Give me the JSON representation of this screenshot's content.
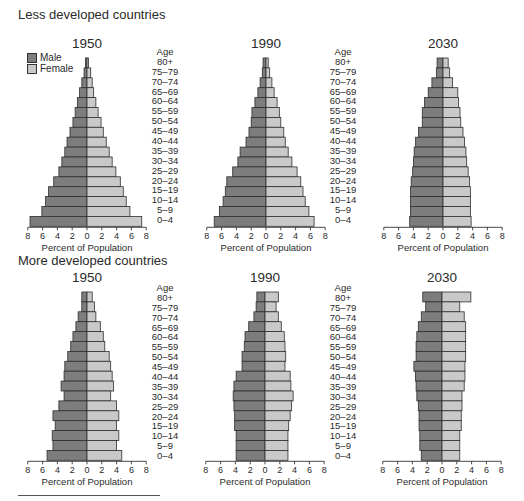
{
  "colors": {
    "male": "#7d7d7d",
    "female": "#c9c9c9",
    "stroke": "#2f2f2f"
  },
  "legend": [
    {
      "label": "Male",
      "series": "male"
    },
    {
      "label": "Female",
      "series": "female"
    }
  ],
  "sections": [
    {
      "title": "Less developed countries"
    },
    {
      "title": "More developed countries"
    }
  ],
  "age_header": "Age",
  "age_groups": [
    "80+",
    "75–79",
    "70–74",
    "65–69",
    "60–64",
    "55–59",
    "50–54",
    "45–49",
    "40–44",
    "35–39",
    "30–34",
    "25–29",
    "20–24",
    "15–19",
    "10–14",
    "5–9",
    "0–4"
  ],
  "chart_data": [
    {
      "type": "bar",
      "orientation": "horizontal-pyramid",
      "group": "Less developed countries",
      "title": "1950",
      "xlabel": "Percent of Population",
      "ylabel": "Age",
      "xticks": [
        "8",
        "6",
        "4",
        "2",
        "0",
        "2",
        "4",
        "6",
        "8"
      ],
      "xlim": [
        -8,
        8
      ],
      "categories": [
        "80+",
        "75–79",
        "70–74",
        "65–69",
        "60–64",
        "55–59",
        "50–54",
        "45–49",
        "40–44",
        "35–39",
        "30–34",
        "25–29",
        "20–24",
        "15–19",
        "10–14",
        "5–9",
        "0–4"
      ],
      "series": [
        {
          "name": "Male",
          "values": [
            0.2,
            0.4,
            0.7,
            1.0,
            1.3,
            1.6,
            1.9,
            2.3,
            2.7,
            3.0,
            3.4,
            3.8,
            4.5,
            5.2,
            5.6,
            6.1,
            7.7
          ]
        },
        {
          "name": "Female",
          "values": [
            0.2,
            0.5,
            0.7,
            0.9,
            1.2,
            1.5,
            1.9,
            2.2,
            2.6,
            3.0,
            3.4,
            3.9,
            4.5,
            4.9,
            5.3,
            5.8,
            7.4
          ]
        }
      ],
      "legend": "top-left"
    },
    {
      "type": "bar",
      "orientation": "horizontal-pyramid",
      "group": "Less developed countries",
      "title": "1990",
      "xlabel": "Percent of Population",
      "ylabel": "Age",
      "xticks": [
        "8",
        "6",
        "4",
        "2",
        "0",
        "2",
        "4",
        "6",
        "8"
      ],
      "xlim": [
        -8,
        8
      ],
      "categories": [
        "80+",
        "75–79",
        "70–74",
        "65–69",
        "60–64",
        "55–59",
        "50–54",
        "45–49",
        "40–44",
        "35–39",
        "30–34",
        "25–29",
        "20–24",
        "15–19",
        "10–14",
        "5–9",
        "0–4"
      ],
      "series": [
        {
          "name": "Male",
          "values": [
            0.4,
            0.5,
            0.8,
            1.1,
            1.5,
            1.9,
            2.0,
            2.3,
            2.7,
            3.5,
            3.8,
            4.5,
            5.3,
            5.5,
            5.8,
            6.3,
            7.0
          ]
        },
        {
          "name": "Female",
          "values": [
            0.3,
            0.5,
            0.8,
            1.1,
            1.5,
            1.8,
            2.0,
            2.4,
            2.6,
            3.0,
            3.5,
            4.2,
            4.7,
            5.0,
            5.3,
            5.8,
            6.5
          ]
        }
      ]
    },
    {
      "type": "bar",
      "orientation": "horizontal-pyramid",
      "group": "Less developed countries",
      "title": "2030",
      "xlabel": "Percent of Population",
      "ylabel": "Age",
      "xticks": [
        "8",
        "6",
        "4",
        "2",
        "0",
        "2",
        "4",
        "6",
        "8"
      ],
      "xlim": [
        -8,
        8
      ],
      "categories": [
        "80+",
        "75–79",
        "70–74",
        "65–69",
        "60–64",
        "55–59",
        "50–54",
        "45–49",
        "40–44",
        "35–39",
        "30–34",
        "25–29",
        "20–24",
        "15–19",
        "10–14",
        "5–9",
        "0–4"
      ],
      "series": [
        {
          "name": "Male",
          "values": [
            0.8,
            0.9,
            1.5,
            2.0,
            2.5,
            2.8,
            2.8,
            3.3,
            3.7,
            3.9,
            4.0,
            4.1,
            4.3,
            4.4,
            4.4,
            4.4,
            4.5
          ]
        },
        {
          "name": "Female",
          "values": [
            0.7,
            0.9,
            1.3,
            2.0,
            2.1,
            2.3,
            2.4,
            2.7,
            2.9,
            3.1,
            3.2,
            3.4,
            3.6,
            3.7,
            3.7,
            3.7,
            3.8
          ]
        }
      ]
    },
    {
      "type": "bar",
      "orientation": "horizontal-pyramid",
      "group": "More developed countries",
      "title": "1950",
      "xlabel": "Percent of Population",
      "ylabel": "Age",
      "xticks": [
        "8",
        "6",
        "4",
        "2",
        "0",
        "2",
        "4",
        "6",
        "8"
      ],
      "xlim": [
        -8,
        8
      ],
      "categories": [
        "80+",
        "75–79",
        "70–74",
        "65–69",
        "60–64",
        "55–59",
        "50–54",
        "45–49",
        "40–44",
        "35–39",
        "30–34",
        "25–29",
        "20–24",
        "15–19",
        "10–14",
        "5–9",
        "0–4"
      ],
      "series": [
        {
          "name": "Male",
          "values": [
            0.7,
            0.7,
            1.2,
            1.5,
            1.9,
            2.2,
            2.6,
            3.0,
            3.1,
            3.5,
            3.1,
            3.8,
            4.6,
            4.3,
            4.7,
            4.6,
            5.4
          ]
        },
        {
          "name": "Female",
          "values": [
            0.7,
            1.0,
            1.2,
            1.8,
            2.2,
            2.4,
            3.0,
            3.2,
            3.4,
            3.6,
            3.2,
            4.0,
            4.3,
            4.0,
            4.3,
            4.0,
            4.7
          ]
        }
      ]
    },
    {
      "type": "bar",
      "orientation": "horizontal-pyramid",
      "group": "More developed countries",
      "title": "1990",
      "xlabel": "Percent of Population",
      "ylabel": "Age",
      "xticks": [
        "8",
        "6",
        "4",
        "2",
        "0",
        "2",
        "4",
        "6",
        "8"
      ],
      "xlim": [
        -8,
        8
      ],
      "categories": [
        "80+",
        "75–79",
        "70–74",
        "65–69",
        "60–64",
        "55–59",
        "50–54",
        "45–49",
        "40–44",
        "35–39",
        "30–34",
        "25–29",
        "20–24",
        "15–19",
        "10–14",
        "5–9",
        "0–4"
      ],
      "series": [
        {
          "name": "Male",
          "values": [
            1.1,
            1.2,
            1.5,
            2.2,
            2.7,
            2.8,
            3.1,
            3.1,
            3.9,
            4.2,
            4.3,
            4.2,
            4.1,
            4.1,
            3.9,
            3.9,
            3.9
          ]
        },
        {
          "name": "Female",
          "values": [
            1.8,
            1.5,
            1.8,
            2.2,
            2.6,
            2.7,
            2.8,
            2.7,
            3.4,
            3.5,
            3.8,
            3.6,
            3.4,
            3.2,
            3.1,
            3.1,
            3.1
          ]
        }
      ]
    },
    {
      "type": "bar",
      "orientation": "horizontal-pyramid",
      "group": "More developed countries",
      "title": "2030",
      "xlabel": "Percent of Population",
      "ylabel": "Age",
      "xticks": [
        "8",
        "6",
        "4",
        "2",
        "0",
        "2",
        "4",
        "6",
        "8"
      ],
      "xlim": [
        -8,
        8
      ],
      "categories": [
        "80+",
        "75–79",
        "70–74",
        "65–69",
        "60–64",
        "55–59",
        "50–54",
        "45–49",
        "40–44",
        "35–39",
        "30–34",
        "25–29",
        "20–24",
        "15–19",
        "10–14",
        "5–9",
        "0–4"
      ],
      "series": [
        {
          "name": "Male",
          "values": [
            2.6,
            2.2,
            2.8,
            3.2,
            3.4,
            3.5,
            3.5,
            3.8,
            3.6,
            3.5,
            3.4,
            3.2,
            3.1,
            3.1,
            3.0,
            3.0,
            2.8
          ]
        },
        {
          "name": "Female",
          "values": [
            3.9,
            2.4,
            3.0,
            3.2,
            3.2,
            3.2,
            3.2,
            3.1,
            3.1,
            3.0,
            2.7,
            2.7,
            2.6,
            2.6,
            2.4,
            2.4,
            2.4
          ]
        }
      ]
    }
  ]
}
